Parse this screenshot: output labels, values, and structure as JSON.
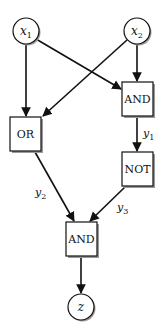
{
  "diagram": {
    "type": "logic-circuit",
    "colors": {
      "stroke": "#111111",
      "fill": "#ffffff",
      "shadow": "#9a9a9a"
    },
    "nodes": {
      "x1": {
        "label": "x",
        "sub": "1",
        "shape": "circle"
      },
      "x2": {
        "label": "x",
        "sub": "2",
        "shape": "circle"
      },
      "and_top": {
        "label": "AND",
        "shape": "box"
      },
      "or": {
        "label": "OR",
        "shape": "box"
      },
      "not": {
        "label": "NOT",
        "shape": "box"
      },
      "and_bottom": {
        "label": "AND",
        "shape": "box"
      },
      "z": {
        "label": "z",
        "shape": "circle"
      }
    },
    "edges": [
      {
        "from": "x1",
        "to": "or",
        "label": ""
      },
      {
        "from": "x1",
        "to": "and_top",
        "label": ""
      },
      {
        "from": "x2",
        "to": "or",
        "label": ""
      },
      {
        "from": "x2",
        "to": "and_top",
        "label": ""
      },
      {
        "from": "and_top",
        "to": "not",
        "label": "y1"
      },
      {
        "from": "or",
        "to": "and_bottom",
        "label": "y2"
      },
      {
        "from": "not",
        "to": "and_bottom",
        "label": "y3"
      },
      {
        "from": "and_bottom",
        "to": "z",
        "label": ""
      }
    ],
    "edge_labels": {
      "y1": {
        "label": "y",
        "sub": "1"
      },
      "y2": {
        "label": "y",
        "sub": "2"
      },
      "y3": {
        "label": "y",
        "sub": "3"
      }
    }
  }
}
